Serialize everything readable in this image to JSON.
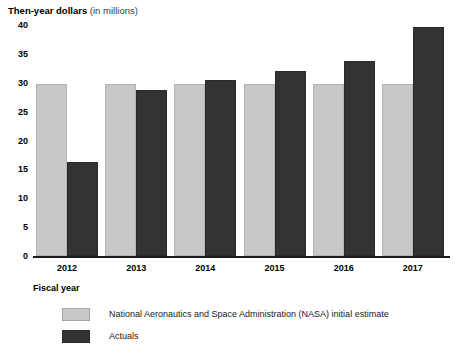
{
  "chart_data": {
    "type": "bar",
    "title": "Then-year dollars (in millions)",
    "title_bold_part": "Then-year dollars",
    "title_regular_part": " (in millions)",
    "xlabel": "Fiscal year",
    "ylabel": "Then-year dollars (in millions)",
    "categories": [
      "2012",
      "2013",
      "2014",
      "2015",
      "2016",
      "2017"
    ],
    "ylim": [
      0,
      40
    ],
    "yticks": [
      0,
      5,
      10,
      15,
      20,
      25,
      30,
      35,
      40
    ],
    "ytick_labels": [
      "0",
      "5",
      "10",
      "15",
      "20",
      "25",
      "30",
      "35",
      "40"
    ],
    "grid": false,
    "legend_position": "bottom-left",
    "series": [
      {
        "name": "National Aeronautics and Space Administration (NASA) initial estimate",
        "color": "#c8c8c8",
        "values": [
          29.7,
          29.7,
          29.7,
          29.7,
          29.7,
          29.7
        ]
      },
      {
        "name": "Actuals",
        "color": "#333333",
        "values": [
          16.2,
          28.8,
          30.5,
          32.0,
          33.8,
          39.7
        ]
      }
    ]
  },
  "legend": {
    "items": [
      {
        "label": "National Aeronautics and Space Administration (NASA) initial estimate",
        "swatch": "estimate"
      },
      {
        "label": "Actuals",
        "swatch": "actual"
      }
    ]
  }
}
